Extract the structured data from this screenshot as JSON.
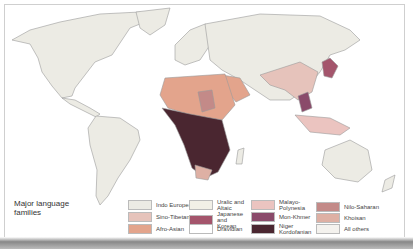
{
  "legend": {
    "title": "Major language families",
    "items": [
      {
        "label": "Indo European",
        "color": "#ecebe4"
      },
      {
        "label": "Sino-Tibetan",
        "color": "#e6c3bb"
      },
      {
        "label": "Afro-Asian",
        "color": "#e3a48c"
      },
      {
        "label": "Uralic and Altaic",
        "color": "#f1efe6"
      },
      {
        "label": "Japanese and Korean",
        "color": "#a4556c"
      },
      {
        "label": "Dravidian",
        "color": "#ffffff"
      },
      {
        "label": "Malayo-Polynesia",
        "color": "#ebc4c0"
      },
      {
        "label": "Mon-Khmer",
        "color": "#8a4a6a"
      },
      {
        "label": "Niger Kordofanian",
        "color": "#4a2630"
      },
      {
        "label": "Nilo-Saharan",
        "color": "#c38a88"
      },
      {
        "label": "Khoisan",
        "color": "#deb0a4"
      },
      {
        "label": "All others",
        "color": "#f4f2ee"
      }
    ]
  },
  "colors": {
    "land": "#ecebe4",
    "outline": "#9a9a9a",
    "ocean": "#ffffff"
  }
}
